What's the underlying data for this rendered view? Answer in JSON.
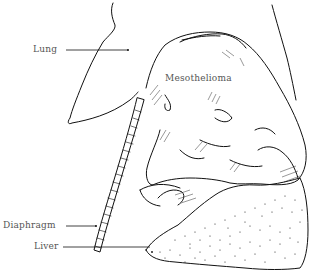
{
  "figure": {
    "type": "anatomical line illustration",
    "ink_color": "#111111",
    "label_color": "#555555",
    "background": "#ffffff"
  },
  "labels": {
    "lung": "Lung",
    "mesothelioma": "Mesothelioma",
    "diaphragm": "Diaphragm",
    "liver": "Liver"
  }
}
